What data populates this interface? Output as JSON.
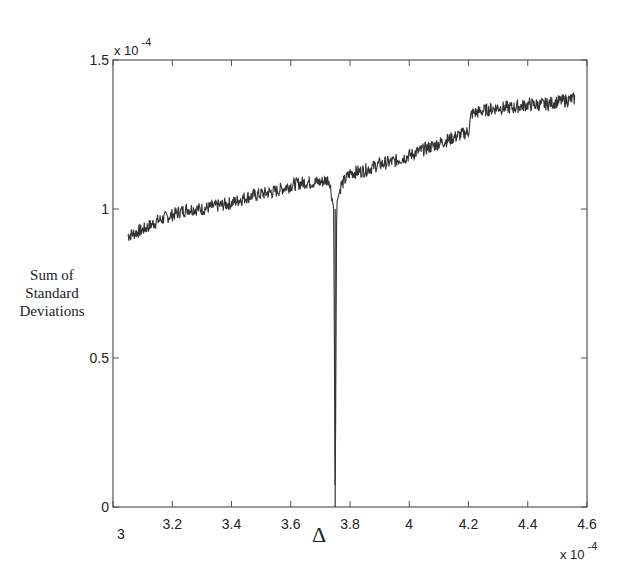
{
  "chart_data": {
    "type": "line",
    "title": "",
    "xlabel": "Δ",
    "ylabel": "Sum of Standard Deviations",
    "ylabel_lines": [
      "Sum of",
      "Standard",
      "Deviations"
    ],
    "x_multiplier": "x 10",
    "x_multiplier_exp": "-4",
    "y_multiplier": "x 10",
    "y_multiplier_exp": "-4",
    "xlim": [
      3,
      4.6
    ],
    "ylim": [
      0,
      1.5
    ],
    "xticks": [
      "3",
      "3.2",
      "3.4",
      "3.6",
      "3.8",
      "4",
      "4.2",
      "4.4",
      "4.6"
    ],
    "yticks": [
      "0",
      "0.5",
      "1",
      "1.5"
    ],
    "grid": false,
    "legend": null,
    "series": [
      {
        "name": "Sum of Standard Deviations",
        "color": "#333333",
        "x": [
          3.05,
          3.1,
          3.15,
          3.2,
          3.25,
          3.3,
          3.35,
          3.4,
          3.45,
          3.5,
          3.55,
          3.6,
          3.65,
          3.7,
          3.73,
          3.745,
          3.75,
          3.755,
          3.77,
          3.8,
          3.85,
          3.9,
          3.95,
          4.0,
          4.05,
          4.1,
          4.15,
          4.2,
          4.21,
          4.25,
          4.3,
          4.35,
          4.4,
          4.45,
          4.5,
          4.56
        ],
        "values": [
          0.91,
          0.93,
          0.96,
          0.98,
          1.0,
          1.0,
          1.01,
          1.02,
          1.04,
          1.05,
          1.06,
          1.08,
          1.09,
          1.09,
          1.1,
          1.0,
          0.0,
          1.02,
          1.08,
          1.12,
          1.13,
          1.15,
          1.16,
          1.18,
          1.2,
          1.22,
          1.24,
          1.26,
          1.32,
          1.33,
          1.34,
          1.34,
          1.35,
          1.35,
          1.36,
          1.37
        ]
      }
    ],
    "annotations": [
      {
        "text": "sharp dip to 0 near Δ ≈ 3.75e-4",
        "x": 3.75,
        "y": 0
      }
    ]
  }
}
